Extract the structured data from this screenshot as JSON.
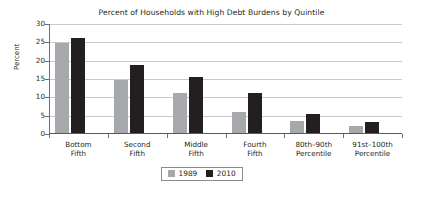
{
  "chart_data": {
    "type": "bar",
    "title": "Percent of Households with High Debt Burdens by Quintile",
    "xlabel": "",
    "ylabel": "Percent",
    "ylim": [
      0,
      30
    ],
    "yticks": [
      0,
      5,
      10,
      15,
      20,
      25,
      30
    ],
    "ytick_labels": [
      "0",
      "5",
      "10",
      "15",
      "20",
      "25",
      "30"
    ],
    "grid": true,
    "legend_position": "bottom-center",
    "categories": [
      "Bottom Fifth",
      "Second Fifth",
      "Middle Fifth",
      "Fourth Fifth",
      "80th–90th Percentile",
      "91st–100th Percentile"
    ],
    "category_lines": [
      [
        "Bottom",
        "Fifth"
      ],
      [
        "Second",
        "Fifth"
      ],
      [
        "Middle",
        "Fifth"
      ],
      [
        "Fourth",
        "Fifth"
      ],
      [
        "80th–90th",
        "Percentile"
      ],
      [
        "91st–100th",
        "Percentile"
      ]
    ],
    "series": [
      {
        "name": "1989",
        "color": "#a6a8ab",
        "values": [
          24.5,
          14.5,
          11.0,
          5.8,
          3.4,
          2.0
        ]
      },
      {
        "name": "2010",
        "color": "#231f20",
        "values": [
          26.0,
          18.6,
          15.3,
          11.0,
          5.3,
          3.0
        ]
      }
    ]
  },
  "legend": {
    "entries": [
      {
        "label": "1989"
      },
      {
        "label": "2010"
      }
    ]
  }
}
